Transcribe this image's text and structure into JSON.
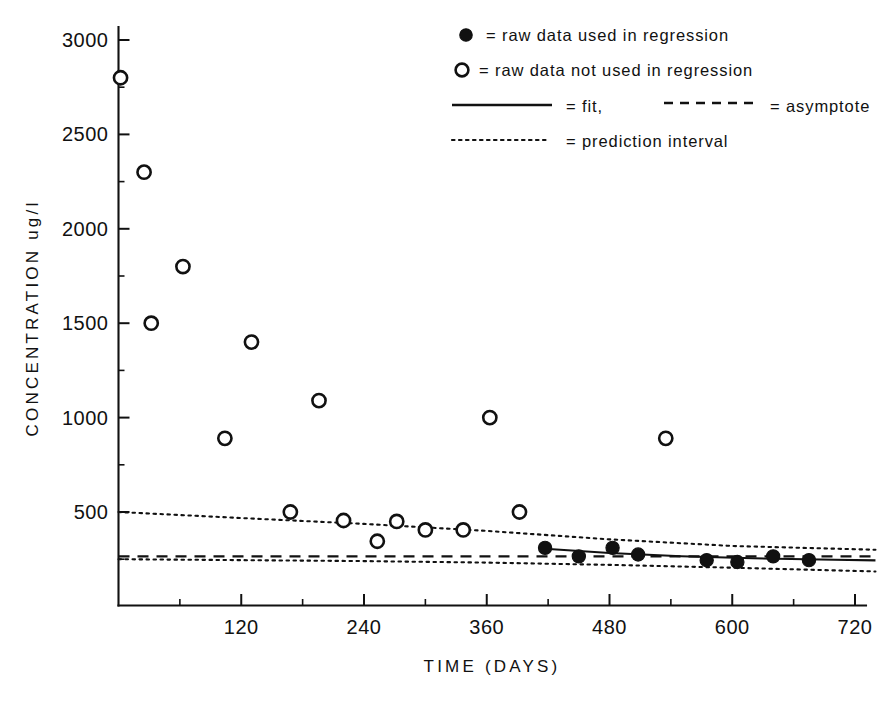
{
  "chart_data": {
    "type": "scatter",
    "title": "",
    "xlabel": "TIME (DAYS)",
    "ylabel": "CONCENTRATION  ug/l",
    "xlim": [
      0,
      740
    ],
    "ylim": [
      -25,
      3100
    ],
    "grid": false,
    "x_ticks": [
      120,
      240,
      360,
      480,
      600,
      720
    ],
    "x_tick_labels": [
      "120",
      "240",
      "360",
      "480",
      "600",
      "720"
    ],
    "x_minor_ticks": [
      60,
      180,
      300,
      420,
      540,
      660
    ],
    "y_ticks": [
      500,
      1000,
      1500,
      2000,
      2500,
      3000
    ],
    "y_tick_labels": [
      "500",
      "1000",
      "1500",
      "2000",
      "2500",
      "3000"
    ],
    "y_minor_ticks": [
      250,
      750,
      1250,
      1750,
      2250,
      2750
    ],
    "legend_position": "top-right",
    "series": [
      {
        "name": "raw data used in regression",
        "marker": "filled-circle",
        "points": [
          [
            417,
            310
          ],
          [
            450,
            265
          ],
          [
            483,
            310
          ],
          [
            508,
            275
          ],
          [
            575,
            245
          ],
          [
            605,
            235
          ],
          [
            640,
            265
          ],
          [
            675,
            245
          ]
        ]
      },
      {
        "name": "raw data not used in regression",
        "marker": "open-circle",
        "points": [
          [
            2,
            2800
          ],
          [
            25,
            2300
          ],
          [
            63,
            1800
          ],
          [
            32,
            1500
          ],
          [
            130,
            1400
          ],
          [
            104,
            890
          ],
          [
            196,
            1090
          ],
          [
            168,
            500
          ],
          [
            220,
            455
          ],
          [
            253,
            345
          ],
          [
            272,
            450
          ],
          [
            300,
            405
          ],
          [
            337,
            405
          ],
          [
            363,
            1000
          ],
          [
            392,
            500
          ],
          [
            535,
            890
          ]
        ]
      }
    ],
    "curves": [
      {
        "name": "fit",
        "style": "solid",
        "points": [
          [
            417,
            305
          ],
          [
            480,
            283
          ],
          [
            550,
            266
          ],
          [
            620,
            255
          ],
          [
            700,
            247
          ],
          [
            740,
            244
          ]
        ]
      },
      {
        "name": "asymptote",
        "style": "dashed",
        "points": [
          [
            0,
            265
          ],
          [
            740,
            265
          ]
        ]
      },
      {
        "name": "prediction interval upper",
        "style": "dotted",
        "points": [
          [
            0,
            500
          ],
          [
            120,
            468
          ],
          [
            240,
            437
          ],
          [
            360,
            400
          ],
          [
            480,
            355
          ],
          [
            600,
            320
          ],
          [
            740,
            300
          ]
        ]
      },
      {
        "name": "prediction interval lower",
        "style": "dotted",
        "points": [
          [
            0,
            250
          ],
          [
            120,
            245
          ],
          [
            240,
            240
          ],
          [
            360,
            232
          ],
          [
            480,
            220
          ],
          [
            600,
            205
          ],
          [
            740,
            185
          ]
        ]
      }
    ]
  },
  "legend": {
    "items": [
      {
        "symbol": "filled-circle",
        "text": "= raw data used in regression"
      },
      {
        "symbol": "open-circle",
        "text": "= raw data not used in regression"
      },
      {
        "symbol": "solid-line",
        "text": "= fit,"
      },
      {
        "symbol": "dashed-line",
        "text": "= asymptote"
      },
      {
        "symbol": "dotted-line",
        "text": "= prediction interval"
      }
    ]
  },
  "axes": {
    "x_title": "TIME (DAYS)",
    "y_title": "CONCENTRATION  ug/l",
    "x_labels": [
      "120",
      "240",
      "360",
      "480",
      "600",
      "720"
    ],
    "y_labels": [
      "500",
      "1000",
      "1500",
      "2000",
      "2500",
      "3000"
    ]
  },
  "colors": {
    "ink": "#111111",
    "background": "#ffffff"
  }
}
